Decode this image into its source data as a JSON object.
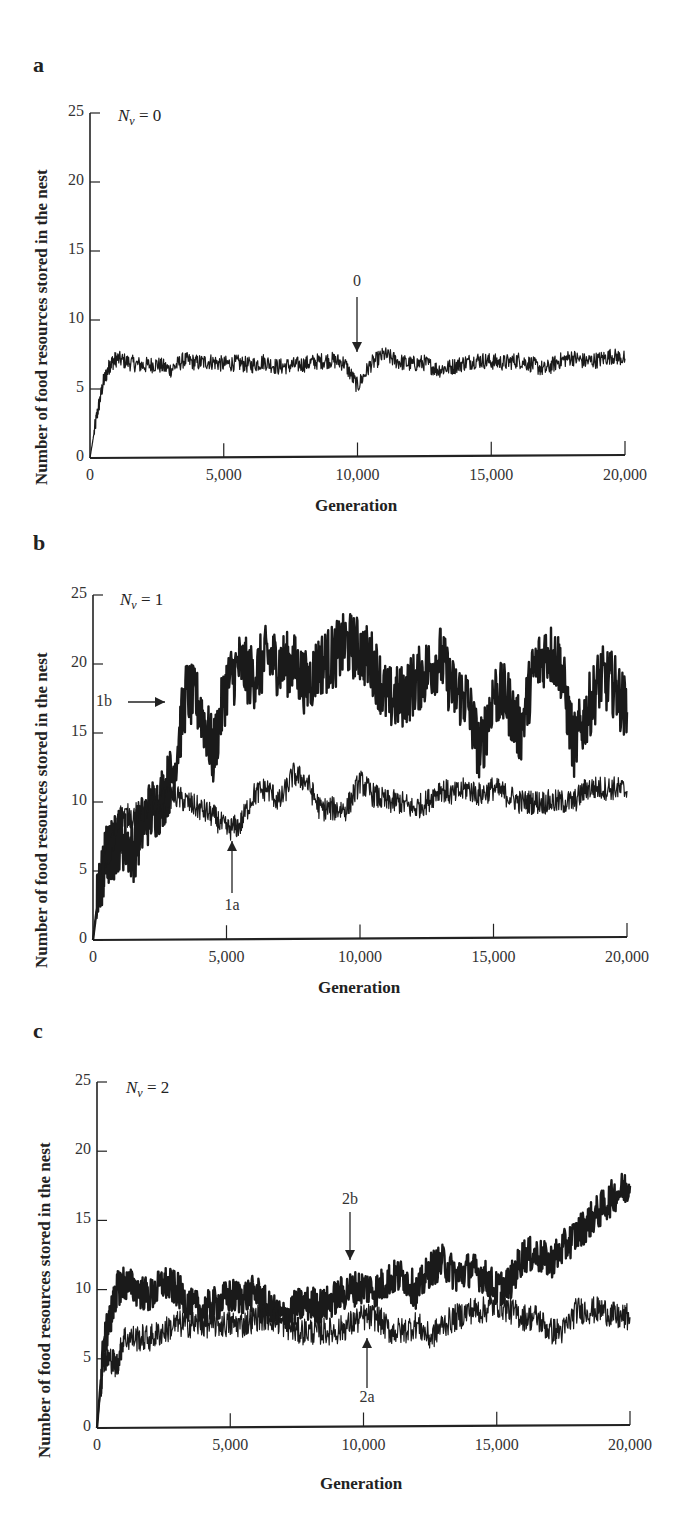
{
  "figure": {
    "panels": [
      {
        "letter": "a",
        "nv_label": "N",
        "nv_sub": "ν",
        "nv_eq": " = 0"
      },
      {
        "letter": "b",
        "nv_label": "N",
        "nv_sub": "ν",
        "nv_eq": " = 1"
      },
      {
        "letter": "c",
        "nv_label": "N",
        "nv_sub": "ν",
        "nv_eq": " = 2"
      }
    ],
    "ylabel": "Number of food resources stored in the nest",
    "xlabel": "Generation",
    "yticks": [
      "0",
      "5",
      "10",
      "15",
      "20",
      "25"
    ],
    "xticks": [
      "0",
      "5,000",
      "10,000",
      "15,000",
      "20,000"
    ],
    "annotations": {
      "a": [
        {
          "text": "0",
          "x": 10000,
          "direction": "down"
        }
      ],
      "b": [
        {
          "text": "1b",
          "x": 3000,
          "y": 17,
          "direction": "right"
        },
        {
          "text": "1a",
          "x": 5200,
          "direction": "up"
        }
      ],
      "c": [
        {
          "text": "2b",
          "x": 9500,
          "direction": "down"
        },
        {
          "text": "2a",
          "x": 10200,
          "direction": "up"
        }
      ]
    }
  },
  "chart_data": [
    {
      "type": "line",
      "title": "a  (N_v = 0)",
      "xlabel": "Generation",
      "ylabel": "Number of food resources stored in the nest",
      "xlim": [
        0,
        20000
      ],
      "ylim": [
        0,
        25
      ],
      "grid": false,
      "x": [
        0,
        250,
        500,
        750,
        1000,
        1500,
        2000,
        2500,
        3000,
        3500,
        4000,
        4500,
        5000,
        5500,
        6000,
        6500,
        7000,
        7500,
        8000,
        8500,
        9000,
        9500,
        10000,
        10500,
        11000,
        11500,
        12000,
        12500,
        13000,
        13500,
        14000,
        14500,
        15000,
        15500,
        16000,
        16500,
        17000,
        17500,
        18000,
        18500,
        19000,
        19500,
        20000
      ],
      "series": [
        {
          "name": "0",
          "noise": 0.6,
          "weight": "thin",
          "values": [
            0,
            3,
            5.5,
            6.8,
            7.2,
            6.9,
            6.7,
            6.8,
            6.4,
            7.1,
            6.9,
            7.0,
            6.8,
            6.9,
            6.7,
            7.0,
            6.6,
            6.7,
            6.8,
            7.0,
            7.1,
            6.9,
            5.2,
            6.8,
            7.5,
            7.0,
            6.8,
            6.9,
            6.4,
            6.6,
            6.9,
            7.1,
            7.0,
            6.9,
            7.1,
            6.8,
            6.4,
            7.0,
            7.3,
            7.0,
            7.1,
            7.4,
            7.2
          ]
        }
      ]
    },
    {
      "type": "line",
      "title": "b  (N_v = 1)",
      "xlabel": "Generation",
      "ylabel": "Number of food resources stored in the nest",
      "xlim": [
        0,
        20000
      ],
      "ylim": [
        0,
        25
      ],
      "grid": false,
      "x": [
        0,
        250,
        500,
        750,
        1000,
        1500,
        2000,
        2500,
        3000,
        3500,
        4000,
        4500,
        5000,
        5500,
        6000,
        6500,
        7000,
        7500,
        8000,
        8500,
        9000,
        9500,
        10000,
        10500,
        11000,
        11500,
        12000,
        12500,
        13000,
        13500,
        14000,
        14500,
        15000,
        15500,
        16000,
        16500,
        17000,
        17500,
        18000,
        18500,
        19000,
        19500,
        20000
      ],
      "series": [
        {
          "name": "1b",
          "noise": 2.4,
          "weight": "thick",
          "values": [
            0,
            4,
            6,
            6.5,
            7.5,
            6.5,
            9,
            10,
            12,
            18,
            17,
            13.5,
            18.5,
            20,
            19,
            20.5,
            20,
            20,
            18.5,
            20,
            20.5,
            21.5,
            21,
            20,
            17.5,
            17.5,
            18.5,
            19.5,
            20.5,
            18,
            17.5,
            13.5,
            18,
            17.5,
            15,
            19.5,
            21,
            20,
            14,
            16.5,
            19,
            18.5,
            16.5
          ]
        },
        {
          "name": "1a",
          "noise": 0.9,
          "weight": "thin",
          "values": [
            0,
            4,
            6,
            7,
            9,
            9,
            9.5,
            10,
            10.5,
            10,
            9.5,
            9,
            8,
            8.3,
            10.5,
            11,
            10,
            12,
            11.5,
            9.5,
            9.5,
            9.5,
            11.5,
            10.5,
            10,
            10,
            9.5,
            10,
            11,
            10.5,
            11,
            10.5,
            11,
            10.5,
            10,
            10,
            10,
            10,
            10,
            11,
            11,
            11,
            10.8
          ]
        }
      ]
    },
    {
      "type": "line",
      "title": "c  (N_v = 2)",
      "xlabel": "Generation",
      "ylabel": "Number of food resources stored in the nest",
      "xlim": [
        0,
        20000
      ],
      "ylim": [
        0,
        25
      ],
      "grid": false,
      "x": [
        0,
        250,
        500,
        750,
        1000,
        1500,
        2000,
        2500,
        3000,
        3500,
        4000,
        4500,
        5000,
        5500,
        6000,
        6500,
        7000,
        7500,
        8000,
        8500,
        9000,
        9500,
        10000,
        10500,
        11000,
        11500,
        12000,
        12500,
        13000,
        13500,
        14000,
        14500,
        15000,
        15500,
        16000,
        16500,
        17000,
        17500,
        18000,
        18500,
        19000,
        19500,
        20000
      ],
      "series": [
        {
          "name": "2b",
          "noise": 1.3,
          "weight": "thick",
          "values": [
            0,
            6,
            8,
            10,
            10.5,
            10,
            9.5,
            10.5,
            10,
            8.8,
            8.5,
            9.0,
            9.5,
            9.5,
            9.8,
            8.5,
            8.0,
            8.8,
            9.0,
            8.8,
            9.5,
            10,
            10.2,
            10,
            10.8,
            11,
            9.8,
            11.5,
            12,
            11,
            11.5,
            11,
            10,
            10.5,
            12.5,
            12.5,
            12,
            13,
            14,
            15,
            16,
            17,
            17.5
          ]
        },
        {
          "name": "2a",
          "noise": 1.0,
          "weight": "thin",
          "values": [
            0,
            5,
            5,
            4.5,
            6.5,
            6.5,
            6.5,
            7,
            7.5,
            7.5,
            7.5,
            7.5,
            7.5,
            7.5,
            8,
            8,
            7.5,
            7,
            7,
            7,
            7,
            7.5,
            8,
            8,
            7,
            7,
            7.5,
            6.5,
            7.5,
            8,
            8.5,
            8.5,
            9,
            8.5,
            8,
            8,
            7,
            7,
            8.5,
            8.5,
            8.5,
            8,
            8
          ]
        }
      ]
    }
  ]
}
